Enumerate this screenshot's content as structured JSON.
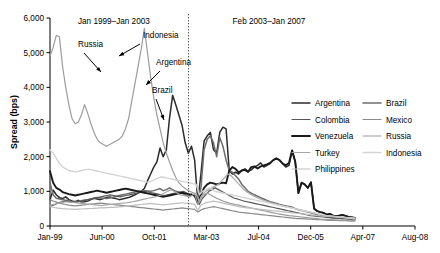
{
  "chart_data": {
    "type": "line",
    "title": "",
    "xlabel": "",
    "ylabel": "Spread (bps)",
    "ylim": [
      0,
      6000
    ],
    "ytickvals": [
      0,
      1000,
      2000,
      3000,
      4000,
      5000,
      6000
    ],
    "yticklabels": [
      "0",
      "1,000",
      "2,000",
      "3,000",
      "4,000",
      "5,000",
      "6,000"
    ],
    "xticklabels": [
      "Jan-99",
      "Jun-00",
      "Oct-01",
      "Mar-03",
      "Jul-04",
      "Dec-05",
      "Apr-07",
      "Aug-08"
    ],
    "grid": false,
    "legend_position": "right-middle",
    "period_labels": [
      {
        "text": "Jan 1999–Jan 2003",
        "x_frac": 0.175
      },
      {
        "text": "Feb 2003–Jan 2007",
        "x_frac": 0.6
      }
    ],
    "divider": {
      "label": "Jan 2003",
      "x_frac": 0.3795,
      "style": "dotted"
    },
    "annotations": [
      {
        "text": "Russia"
      },
      {
        "text": "Indonesia"
      },
      {
        "text": "Argentina"
      },
      {
        "text": "Brazil"
      }
    ],
    "series": [
      {
        "name": "Argentina",
        "color": "#2b2b2b",
        "width": 1.5,
        "values": [
          760,
          1030,
          900,
          820,
          790,
          840,
          760,
          720,
          700,
          740,
          690,
          700,
          720,
          760,
          800,
          780,
          760,
          790,
          820,
          840,
          810,
          790,
          760,
          780,
          800,
          820,
          860,
          900,
          950,
          1000,
          1080,
          1300,
          1500,
          1700,
          1850,
          2250,
          2000,
          2200,
          3100,
          3770,
          3500,
          3200,
          2900,
          2400,
          2100,
          2300,
          1900,
          700,
          1500,
          2450,
          2600,
          2700,
          2200,
          2100,
          2700,
          2850,
          2800,
          1600,
          1500,
          1550,
          1500,
          1600,
          1650,
          1580,
          1620,
          1700,
          1750,
          1820,
          1700,
          1750,
          1800,
          1900,
          1950,
          1900,
          1800,
          1700,
          1750,
          2180,
          1850,
          950,
          1250,
          1200,
          1100,
          1260,
          500,
          430,
          400,
          380,
          330,
          350,
          300,
          280,
          300,
          320,
          290,
          260,
          250,
          230
        ],
        "dash": ""
      },
      {
        "name": "Brazil",
        "color": "#6d6d6d",
        "width": 1.5,
        "values": [
          1250,
          900,
          800,
          780,
          760,
          740,
          720,
          700,
          690,
          710,
          730,
          750,
          760,
          780,
          800,
          820,
          810,
          800,
          790,
          810,
          830,
          850,
          880,
          900,
          920,
          940,
          960,
          980,
          1000,
          1010,
          1020,
          1010,
          1000,
          1020,
          1050,
          1080,
          1020,
          1050,
          1100,
          1050,
          1000,
          980,
          950,
          900,
          870,
          920,
          880,
          690,
          1100,
          2200,
          2500,
          2600,
          2400,
          2000,
          2550,
          2300,
          1900,
          1600,
          1550,
          1450,
          1350,
          1200,
          1100,
          1000,
          950,
          900,
          860,
          820,
          780,
          740,
          700,
          680,
          650,
          620,
          600,
          580,
          560,
          540,
          500,
          470,
          450,
          430,
          400,
          380,
          350,
          330,
          310,
          290,
          270,
          250,
          240,
          230,
          220,
          215,
          210,
          205,
          200,
          195
        ],
        "dash": ""
      },
      {
        "name": "Colombia",
        "color": "#575757",
        "width": 1.2,
        "values": [
          560,
          600,
          640,
          680,
          700,
          720,
          700,
          690,
          680,
          700,
          720,
          740,
          760,
          780,
          800,
          820,
          840,
          860,
          880,
          900,
          880,
          860,
          840,
          860,
          880,
          900,
          920,
          940,
          960,
          980,
          1000,
          980,
          960,
          940,
          920,
          900,
          880,
          900,
          920,
          940,
          960,
          980,
          1000,
          950,
          900,
          880,
          850,
          620,
          800,
          900,
          1000,
          1050,
          1100,
          1050,
          1000,
          950,
          900,
          850,
          800,
          780,
          750,
          720,
          700,
          680,
          660,
          640,
          620,
          600,
          580,
          560,
          540,
          520,
          500,
          480,
          460,
          440,
          420,
          400,
          380,
          360,
          340,
          320,
          300,
          290,
          280,
          270,
          260,
          250,
          240,
          230,
          225,
          220,
          215,
          210,
          205,
          200,
          195
        ],
        "dash": ""
      },
      {
        "name": "Mexico",
        "color": "#8a8a8a",
        "width": 1.2,
        "values": [
          760,
          720,
          690,
          660,
          640,
          620,
          600,
          590,
          580,
          590,
          600,
          610,
          620,
          630,
          640,
          650,
          660,
          650,
          640,
          630,
          620,
          610,
          600,
          590,
          580,
          570,
          560,
          550,
          540,
          530,
          520,
          510,
          500,
          490,
          480,
          470,
          460,
          470,
          480,
          490,
          500,
          510,
          520,
          510,
          500,
          490,
          480,
          400,
          460,
          500,
          520,
          540,
          560,
          540,
          520,
          500,
          480,
          460,
          440,
          420,
          400,
          390,
          380,
          370,
          360,
          350,
          340,
          330,
          320,
          310,
          300,
          290,
          280,
          270,
          260,
          250,
          240,
          230,
          220,
          215,
          210,
          205,
          200,
          195,
          190,
          185,
          180,
          175,
          170,
          165,
          160,
          158,
          156,
          154,
          152,
          150,
          148,
          145
        ],
        "dash": ""
      },
      {
        "name": "Venezuela",
        "color": "#1a1a1a",
        "width": 1.9,
        "values": [
          1580,
          1250,
          1100,
          1050,
          980,
          950,
          920,
          900,
          880,
          900,
          920,
          940,
          960,
          980,
          1000,
          1020,
          1000,
          980,
          960,
          980,
          1000,
          1020,
          1040,
          1060,
          1080,
          1060,
          1040,
          1020,
          1000,
          980,
          960,
          940,
          920,
          900,
          880,
          860,
          840,
          860,
          880,
          900,
          920,
          940,
          960,
          940,
          920,
          900,
          880,
          650,
          900,
          1100,
          1200,
          1250,
          1230,
          1200,
          1230,
          1250,
          1230,
          1600,
          1700,
          1650,
          1550,
          1600,
          1620,
          1560,
          1700,
          1720,
          1660,
          1720,
          1750,
          1780,
          1820,
          1900,
          1950,
          1900,
          1800,
          1750,
          1820,
          2180,
          1850,
          950,
          1250,
          1200,
          1100,
          1260,
          500,
          430,
          400,
          380,
          330,
          350,
          300,
          280,
          300,
          320,
          290,
          260,
          250,
          230
        ],
        "dash": ""
      },
      {
        "name": "Russia",
        "color": "#9c9c9c",
        "width": 1.2,
        "values": [
          4900,
          5150,
          5500,
          5450,
          4600,
          4000,
          3500,
          3100,
          2950,
          3000,
          3200,
          3500,
          3250,
          2950,
          2700,
          2500,
          2400,
          2350,
          2300,
          2350,
          2400,
          2450,
          2500,
          2600,
          2800,
          3100,
          3600,
          4100,
          4600,
          5100,
          5700,
          5000,
          4300,
          3700,
          3200,
          2800,
          2400,
          2100,
          1850,
          1600,
          1400,
          1250,
          1150,
          1080,
          1020,
          980,
          940,
          620,
          850,
          900,
          950,
          900,
          850,
          800,
          760,
          720,
          690,
          660,
          640,
          620,
          600,
          580,
          560,
          540,
          520,
          500,
          480,
          460,
          440,
          420,
          400,
          380,
          360,
          345,
          330,
          315,
          300,
          290,
          280,
          270,
          260,
          250,
          240,
          230,
          220,
          210,
          200,
          195,
          190,
          185,
          180,
          175,
          170,
          165,
          160,
          155,
          150,
          148
        ],
        "dash": ""
      },
      {
        "name": "Turkey",
        "color": "#a8a8a8",
        "width": 1.2,
        "values": [
          600,
          620,
          640,
          660,
          680,
          700,
          690,
          680,
          670,
          660,
          650,
          640,
          630,
          620,
          610,
          600,
          590,
          600,
          610,
          620,
          630,
          640,
          650,
          660,
          670,
          680,
          700,
          720,
          740,
          760,
          780,
          800,
          820,
          840,
          860,
          900,
          950,
          1000,
          1050,
          1000,
          950,
          900,
          880,
          860,
          840,
          900,
          950,
          700,
          900,
          1000,
          1050,
          1100,
          1150,
          1200,
          1300,
          1400,
          1500,
          1450,
          1350,
          1250,
          1150,
          1050,
          980,
          920,
          870,
          830,
          790,
          750,
          720,
          690,
          660,
          630,
          600,
          580,
          560,
          540,
          520,
          500,
          480,
          460,
          440,
          420,
          400,
          380,
          360,
          340,
          320,
          300,
          290,
          280,
          270,
          260,
          250,
          240,
          230,
          220,
          215
        ],
        "dash": ""
      },
      {
        "name": "Indonesia",
        "color": "#d4d4d4",
        "width": 1.4,
        "values": [
          2200,
          2100,
          1950,
          1800,
          1700,
          1650,
          1600,
          1580,
          1560,
          1580,
          1600,
          1620,
          1640,
          1620,
          1600,
          1580,
          1560,
          1540,
          1520,
          1500,
          1480,
          1460,
          1440,
          1420,
          1400,
          1380,
          1360,
          1340,
          1320,
          1300,
          1280,
          1260,
          1300,
          1340,
          1380,
          1420,
          1400,
          1380,
          1360,
          1340,
          1320,
          1300,
          1280,
          1260,
          1240,
          1220,
          1200,
          900,
          1000,
          1050,
          1100,
          1050,
          1000,
          980,
          960,
          940,
          920,
          900,
          880,
          860,
          840,
          820,
          800,
          780,
          760,
          740,
          720,
          700,
          680,
          660,
          640,
          620,
          600,
          580,
          560,
          540,
          520,
          500,
          480,
          460,
          440,
          420,
          400,
          380,
          360,
          340,
          320,
          300,
          290,
          280,
          270,
          260,
          250,
          240,
          230,
          220,
          210
        ],
        "dash": ""
      },
      {
        "name": "Philippines",
        "color": "#bdbdbd",
        "width": 1.2,
        "values": [
          560,
          540,
          520,
          510,
          500,
          495,
          490,
          485,
          480,
          485,
          490,
          495,
          500,
          505,
          510,
          515,
          520,
          525,
          530,
          535,
          540,
          545,
          550,
          560,
          570,
          580,
          590,
          600,
          610,
          620,
          630,
          640,
          650,
          640,
          630,
          620,
          610,
          620,
          630,
          640,
          650,
          660,
          670,
          660,
          650,
          640,
          630,
          450,
          600,
          650,
          680,
          700,
          720,
          700,
          680,
          660,
          640,
          620,
          600,
          580,
          560,
          545,
          530,
          520,
          510,
          500,
          490,
          480,
          470,
          460,
          450,
          440,
          430,
          420,
          410,
          400,
          390,
          380,
          370,
          360,
          350,
          340,
          330,
          320,
          310,
          300,
          290,
          285,
          280,
          275,
          270,
          265,
          260,
          255,
          250,
          245,
          240,
          235
        ],
        "dash": ""
      }
    ],
    "legend": {
      "col1": [
        "Argentina",
        "Colombia",
        "Venezuela",
        "Turkey",
        "Philippines"
      ],
      "col2": [
        "Brazil",
        "Mexico",
        "Russia",
        "Indonesia"
      ]
    }
  }
}
